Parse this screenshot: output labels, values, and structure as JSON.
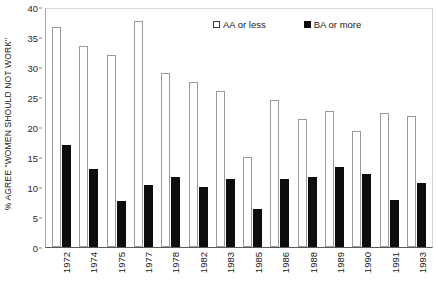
{
  "chart_data": {
    "type": "bar",
    "title": "",
    "xlabel": "",
    "ylabel": "% AGREE \"WOMEN SHOULD NOT WORK\"",
    "ylim": [
      0,
      40
    ],
    "yticks": [
      0,
      5,
      10,
      15,
      20,
      25,
      30,
      35,
      40
    ],
    "grid": false,
    "legend_position": "top-right",
    "categories": [
      "1972",
      "1974",
      "1975",
      "1977",
      "1978",
      "1982",
      "1983",
      "1985",
      "1986",
      "1988",
      "1989",
      "1990",
      "1991",
      "1993"
    ],
    "series": [
      {
        "name": "AA or less",
        "color": "#ffffff",
        "edge_color": "#9a9a9a",
        "values": [
          36.6,
          33.5,
          32.0,
          37.6,
          29.0,
          27.5,
          26.0,
          15.0,
          24.5,
          21.4,
          22.6,
          19.4,
          22.3,
          21.9
        ]
      },
      {
        "name": "BA or more",
        "color": "#0d0d0d",
        "edge_color": "#0d0d0d",
        "values": [
          17.0,
          13.0,
          7.7,
          10.4,
          11.7,
          10.0,
          11.4,
          6.3,
          11.4,
          11.6,
          13.4,
          12.1,
          7.9,
          10.7
        ]
      }
    ]
  },
  "legend": {
    "entries": [
      {
        "label": "AA or less",
        "marker": "hollow-square"
      },
      {
        "label": "BA or more",
        "marker": "filled-square"
      }
    ]
  },
  "caption": ""
}
